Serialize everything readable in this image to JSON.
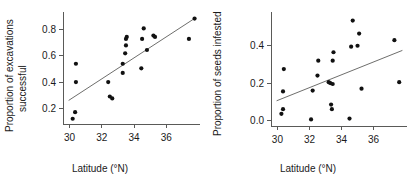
{
  "figure": {
    "panels": [
      {
        "id": "left",
        "xlabel": "Latitude (°N)",
        "ylabel_line1": "Proportion of excavations",
        "ylabel_line2": "successful"
      },
      {
        "id": "right",
        "xlabel": "Latitude (°N)",
        "ylabel_line1": "Proportion of seeds infested",
        "ylabel_line2": ""
      }
    ],
    "colors": {
      "background": "#ffffff",
      "axis": "#5a5a58",
      "point": "#111111",
      "fit_line": "#6e6e6c",
      "text": "#1a1a1a"
    }
  },
  "chart_data": [
    {
      "type": "scatter",
      "panel": "left",
      "title": "",
      "xlabel": "Latitude (°N)",
      "ylabel": "Proportion of excavations successful",
      "xlim": [
        29.6,
        37.9
      ],
      "ylim": [
        0.08,
        0.92
      ],
      "xticks": [
        30,
        32,
        34,
        36
      ],
      "xticklabels": [
        "30",
        "32",
        "34",
        "36"
      ],
      "yticks": [
        0.2,
        0.4,
        0.6,
        0.8
      ],
      "yticklabels": [
        "0.2",
        "0.4",
        "0.6",
        "0.8"
      ],
      "grid": false,
      "legend": false,
      "points": [
        {
          "x": 30.2,
          "y": 0.12
        },
        {
          "x": 30.35,
          "y": 0.17
        },
        {
          "x": 30.4,
          "y": 0.4
        },
        {
          "x": 30.4,
          "y": 0.54
        },
        {
          "x": 32.4,
          "y": 0.4
        },
        {
          "x": 32.5,
          "y": 0.29
        },
        {
          "x": 32.65,
          "y": 0.275
        },
        {
          "x": 33.3,
          "y": 0.47
        },
        {
          "x": 33.3,
          "y": 0.54
        },
        {
          "x": 33.45,
          "y": 0.62
        },
        {
          "x": 33.5,
          "y": 0.68
        },
        {
          "x": 33.5,
          "y": 0.73
        },
        {
          "x": 33.55,
          "y": 0.745
        },
        {
          "x": 34.45,
          "y": 0.505
        },
        {
          "x": 34.5,
          "y": 0.73
        },
        {
          "x": 34.6,
          "y": 0.81
        },
        {
          "x": 34.8,
          "y": 0.645
        },
        {
          "x": 35.2,
          "y": 0.755
        },
        {
          "x": 35.3,
          "y": 0.745
        },
        {
          "x": 37.4,
          "y": 0.73
        },
        {
          "x": 37.75,
          "y": 0.885
        }
      ],
      "fit_line": {
        "x_start": 29.95,
        "y_start": 0.26,
        "x_end": 37.8,
        "y_end": 0.89
      }
    },
    {
      "type": "scatter",
      "panel": "right",
      "title": "",
      "xlabel": "Latitude (°N)",
      "ylabel": "Proportion of seeds infested",
      "xlim": [
        29.6,
        37.9
      ],
      "ylim": [
        -0.03,
        0.57
      ],
      "xticks": [
        30,
        32,
        34,
        36
      ],
      "xticklabels": [
        "30",
        "32",
        "34",
        "36"
      ],
      "yticks": [
        0.0,
        0.2,
        0.4
      ],
      "yticklabels": [
        "0.0",
        "0.2",
        "0.4"
      ],
      "grid": false,
      "legend": false,
      "points": [
        {
          "x": 30.25,
          "y": 0.035
        },
        {
          "x": 30.35,
          "y": 0.06
        },
        {
          "x": 30.35,
          "y": 0.155
        },
        {
          "x": 30.4,
          "y": 0.275
        },
        {
          "x": 32.1,
          "y": 0.005
        },
        {
          "x": 32.2,
          "y": 0.16
        },
        {
          "x": 32.5,
          "y": 0.24
        },
        {
          "x": 32.55,
          "y": 0.32
        },
        {
          "x": 33.2,
          "y": 0.205
        },
        {
          "x": 33.3,
          "y": 0.2
        },
        {
          "x": 33.35,
          "y": 0.085
        },
        {
          "x": 33.4,
          "y": 0.06
        },
        {
          "x": 33.45,
          "y": 0.195
        },
        {
          "x": 33.45,
          "y": 0.32
        },
        {
          "x": 33.5,
          "y": 0.365
        },
        {
          "x": 34.5,
          "y": 0.01
        },
        {
          "x": 34.6,
          "y": 0.395
        },
        {
          "x": 34.7,
          "y": 0.535
        },
        {
          "x": 35.0,
          "y": 0.4
        },
        {
          "x": 35.1,
          "y": 0.465
        },
        {
          "x": 35.25,
          "y": 0.17
        },
        {
          "x": 37.3,
          "y": 0.43
        },
        {
          "x": 37.6,
          "y": 0.205
        }
      ],
      "fit_line": {
        "x_start": 29.95,
        "y_start": 0.105,
        "x_end": 37.8,
        "y_end": 0.375
      }
    }
  ]
}
